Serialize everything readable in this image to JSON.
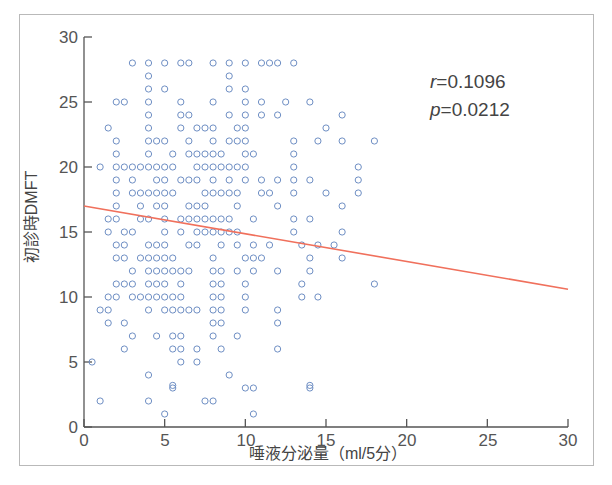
{
  "figure": {
    "background": "#ffffff",
    "frame_color": "#b9b9b9"
  },
  "annotation": {
    "r_symbol": "r",
    "r_value": "=0.1096",
    "p_symbol": "p",
    "p_value": "=0.0212"
  },
  "chart_data": {
    "type": "scatter",
    "title": "",
    "xlabel": "唾液分泌量（ml/5分）",
    "ylabel": "初診時DMFT",
    "xlim": [
      0,
      30
    ],
    "ylim": [
      0,
      30
    ],
    "xticks": [
      0,
      5,
      10,
      15,
      20,
      25,
      30
    ],
    "yticks": [
      0,
      5,
      10,
      15,
      20,
      25,
      30
    ],
    "xtick_labels": [
      "0",
      "5",
      "10",
      "15",
      "20",
      "25",
      "30"
    ],
    "ytick_labels": [
      "0",
      "5",
      "10",
      "15",
      "20",
      "25",
      "30"
    ],
    "grid": false,
    "legend": null,
    "marker": {
      "shape": "open-circle",
      "color": "#6f8fc4",
      "radius": 3.1,
      "linewidth": 1.0,
      "fill": "none"
    },
    "regression_line": {
      "color": "#f0705c",
      "linewidth": 1.6,
      "x_start": 0,
      "y_start": 17.0,
      "x_end": 30,
      "y_end": 10.6,
      "slope": -0.2133,
      "intercept": 17.0
    },
    "statistics": {
      "r": 0.1096,
      "p": 0.0212
    },
    "points": [
      [
        3,
        28
      ],
      [
        4,
        28
      ],
      [
        5,
        28
      ],
      [
        6,
        28
      ],
      [
        6.5,
        28
      ],
      [
        8,
        28
      ],
      [
        9,
        28
      ],
      [
        10,
        28
      ],
      [
        11,
        28
      ],
      [
        11.5,
        28
      ],
      [
        12,
        28
      ],
      [
        13,
        28
      ],
      [
        4,
        27
      ],
      [
        9,
        27
      ],
      [
        4,
        26
      ],
      [
        5,
        26
      ],
      [
        9,
        26
      ],
      [
        10,
        26
      ],
      [
        2,
        25
      ],
      [
        2.5,
        25
      ],
      [
        4,
        25
      ],
      [
        6,
        25
      ],
      [
        8,
        25
      ],
      [
        10,
        25
      ],
      [
        11,
        25
      ],
      [
        12.5,
        25
      ],
      [
        14,
        25
      ],
      [
        4,
        24
      ],
      [
        6,
        24
      ],
      [
        6.5,
        24
      ],
      [
        9,
        24
      ],
      [
        10,
        24
      ],
      [
        11,
        24
      ],
      [
        12,
        24
      ],
      [
        16,
        24
      ],
      [
        1.5,
        23
      ],
      [
        4,
        23
      ],
      [
        6,
        23
      ],
      [
        7,
        23
      ],
      [
        7.5,
        23
      ],
      [
        8,
        23
      ],
      [
        9.5,
        23
      ],
      [
        10,
        23
      ],
      [
        15,
        23
      ],
      [
        2,
        22
      ],
      [
        4,
        22
      ],
      [
        4.5,
        22
      ],
      [
        5,
        22
      ],
      [
        6.5,
        22
      ],
      [
        8,
        22
      ],
      [
        9,
        22
      ],
      [
        9.5,
        22
      ],
      [
        10,
        22
      ],
      [
        13,
        22
      ],
      [
        14.5,
        22
      ],
      [
        16,
        22
      ],
      [
        18,
        22
      ],
      [
        2,
        21
      ],
      [
        4,
        21
      ],
      [
        5.5,
        21
      ],
      [
        6.5,
        21
      ],
      [
        7,
        21
      ],
      [
        7.5,
        21
      ],
      [
        8,
        21
      ],
      [
        8.5,
        21
      ],
      [
        10,
        21
      ],
      [
        10.5,
        21
      ],
      [
        13,
        21
      ],
      [
        1,
        20
      ],
      [
        2,
        20
      ],
      [
        2.5,
        20
      ],
      [
        3,
        20
      ],
      [
        3.5,
        20
      ],
      [
        4,
        20
      ],
      [
        4.5,
        20
      ],
      [
        5,
        20
      ],
      [
        5.5,
        20
      ],
      [
        7,
        20
      ],
      [
        7.5,
        20
      ],
      [
        8,
        20
      ],
      [
        8.5,
        20
      ],
      [
        9,
        20
      ],
      [
        9.5,
        20
      ],
      [
        10,
        20
      ],
      [
        13,
        20
      ],
      [
        17,
        20
      ],
      [
        2,
        19
      ],
      [
        3,
        19
      ],
      [
        4.5,
        19
      ],
      [
        5,
        19
      ],
      [
        6,
        19
      ],
      [
        6.5,
        19
      ],
      [
        7,
        19
      ],
      [
        8,
        19
      ],
      [
        9,
        19
      ],
      [
        10,
        19
      ],
      [
        11,
        19
      ],
      [
        12,
        19
      ],
      [
        13,
        19
      ],
      [
        14,
        19
      ],
      [
        17,
        19
      ],
      [
        2,
        18
      ],
      [
        3,
        18
      ],
      [
        3.5,
        18
      ],
      [
        4,
        18
      ],
      [
        4.5,
        18
      ],
      [
        5,
        18
      ],
      [
        5.5,
        18
      ],
      [
        7.5,
        18
      ],
      [
        8,
        18
      ],
      [
        8.5,
        18
      ],
      [
        9,
        18
      ],
      [
        9.5,
        18
      ],
      [
        11,
        18
      ],
      [
        11.5,
        18
      ],
      [
        13,
        18
      ],
      [
        15,
        18
      ],
      [
        17,
        18
      ],
      [
        2,
        17
      ],
      [
        3.5,
        17
      ],
      [
        4.5,
        17
      ],
      [
        5,
        17
      ],
      [
        6.5,
        17
      ],
      [
        7,
        17
      ],
      [
        7.5,
        17
      ],
      [
        9.5,
        17
      ],
      [
        12,
        17
      ],
      [
        16,
        17
      ],
      [
        1.5,
        16
      ],
      [
        2,
        16
      ],
      [
        3.5,
        16
      ],
      [
        4,
        16
      ],
      [
        5,
        16
      ],
      [
        6,
        16
      ],
      [
        6.5,
        16
      ],
      [
        7,
        16
      ],
      [
        7.5,
        16
      ],
      [
        8,
        16
      ],
      [
        8.5,
        16
      ],
      [
        9,
        16
      ],
      [
        10.5,
        16
      ],
      [
        13,
        16
      ],
      [
        14,
        16
      ],
      [
        1.5,
        15
      ],
      [
        2.5,
        15
      ],
      [
        3,
        15
      ],
      [
        5,
        15
      ],
      [
        6,
        15
      ],
      [
        7,
        15
      ],
      [
        7.5,
        15
      ],
      [
        8,
        15
      ],
      [
        8.5,
        15
      ],
      [
        9,
        15
      ],
      [
        9.5,
        15
      ],
      [
        13,
        15
      ],
      [
        16,
        15
      ],
      [
        2,
        14
      ],
      [
        2.5,
        14
      ],
      [
        4,
        14
      ],
      [
        4.5,
        14
      ],
      [
        5,
        14
      ],
      [
        6.5,
        14
      ],
      [
        7,
        14
      ],
      [
        8.5,
        14
      ],
      [
        9.5,
        14
      ],
      [
        10.5,
        14
      ],
      [
        11.5,
        14
      ],
      [
        13.5,
        14
      ],
      [
        14.5,
        14
      ],
      [
        15.5,
        14
      ],
      [
        2,
        13
      ],
      [
        2.5,
        13
      ],
      [
        3.5,
        13
      ],
      [
        4,
        13
      ],
      [
        4.5,
        13
      ],
      [
        5,
        13
      ],
      [
        5.5,
        13
      ],
      [
        8,
        13
      ],
      [
        10,
        13
      ],
      [
        10.5,
        13
      ],
      [
        11,
        13
      ],
      [
        14,
        13
      ],
      [
        16,
        13
      ],
      [
        3,
        12
      ],
      [
        4,
        12
      ],
      [
        4.5,
        12
      ],
      [
        5,
        12
      ],
      [
        5.5,
        12
      ],
      [
        6,
        12
      ],
      [
        6.5,
        12
      ],
      [
        8,
        12
      ],
      [
        8.5,
        12
      ],
      [
        9.5,
        12
      ],
      [
        10.5,
        12
      ],
      [
        12,
        12
      ],
      [
        14,
        12
      ],
      [
        2,
        11
      ],
      [
        2.5,
        11
      ],
      [
        3,
        11
      ],
      [
        4,
        11
      ],
      [
        4.5,
        11
      ],
      [
        5,
        11
      ],
      [
        6,
        11
      ],
      [
        8,
        11
      ],
      [
        8.5,
        11
      ],
      [
        10,
        11
      ],
      [
        13.5,
        11
      ],
      [
        18,
        11
      ],
      [
        1.5,
        10
      ],
      [
        2,
        10
      ],
      [
        3,
        10
      ],
      [
        3.5,
        10
      ],
      [
        4,
        10
      ],
      [
        4.5,
        10
      ],
      [
        5,
        10
      ],
      [
        5.5,
        10
      ],
      [
        6,
        10
      ],
      [
        8,
        10
      ],
      [
        8.5,
        10
      ],
      [
        10,
        10
      ],
      [
        13.5,
        10
      ],
      [
        14.5,
        10
      ],
      [
        1,
        9
      ],
      [
        1.5,
        9
      ],
      [
        4,
        9
      ],
      [
        5,
        9
      ],
      [
        5.5,
        9
      ],
      [
        6,
        9
      ],
      [
        6.5,
        9
      ],
      [
        7,
        9
      ],
      [
        8,
        9
      ],
      [
        8.5,
        9
      ],
      [
        10,
        9
      ],
      [
        12,
        9
      ],
      [
        1.5,
        8
      ],
      [
        2.5,
        8
      ],
      [
        8,
        8
      ],
      [
        8.5,
        8
      ],
      [
        12,
        8
      ],
      [
        3,
        7
      ],
      [
        4.5,
        7
      ],
      [
        5.5,
        7
      ],
      [
        6,
        7
      ],
      [
        8,
        7
      ],
      [
        9.5,
        7
      ],
      [
        2.5,
        6
      ],
      [
        5.5,
        6
      ],
      [
        6,
        6
      ],
      [
        7,
        6
      ],
      [
        8.5,
        6
      ],
      [
        12,
        6
      ],
      [
        0.5,
        5
      ],
      [
        6,
        5
      ],
      [
        7,
        5
      ],
      [
        4,
        4
      ],
      [
        9,
        4
      ],
      [
        5.5,
        3
      ],
      [
        5.5,
        3.2
      ],
      [
        10,
        3
      ],
      [
        10.5,
        3
      ],
      [
        14,
        3
      ],
      [
        14,
        3.2
      ],
      [
        4,
        2
      ],
      [
        1,
        2
      ],
      [
        7.5,
        2
      ],
      [
        8,
        2
      ],
      [
        5,
        1
      ],
      [
        10.5,
        1
      ]
    ]
  }
}
